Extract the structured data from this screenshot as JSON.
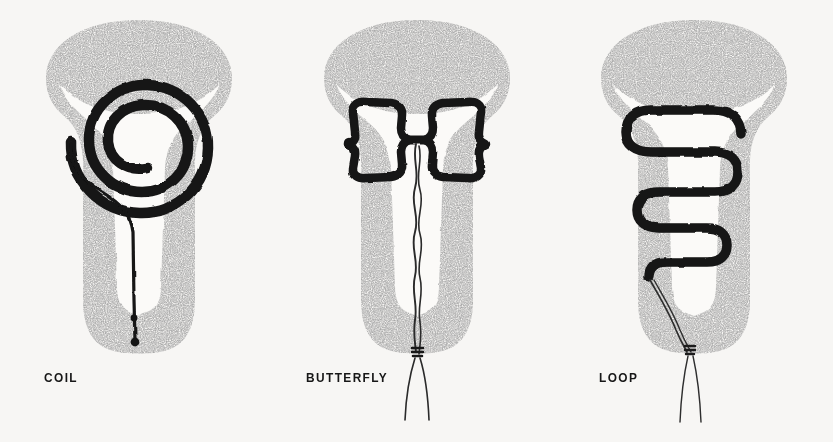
{
  "plate": {
    "title": "Intrauterine contraceptive device types",
    "background_color": "#f7f6f4",
    "ink_color": "#111111",
    "tissue_color": "#8d8d8d"
  },
  "figures": [
    {
      "id": "coil",
      "label": "COIL",
      "device_name": "coil-iud",
      "device_shape": "spiral",
      "device_turns": 2.5,
      "string_style": "single-thick-line",
      "string_markers": 2,
      "string_extends_beyond_cervix": false,
      "organ": "uterus-coronal-section"
    },
    {
      "id": "butterfly",
      "label": "BUTTERFLY",
      "device_name": "butterfly-iud",
      "device_shape": "двух-lobed-bowtie",
      "device_lobes": 2,
      "string_style": "wavy-double-thread",
      "string_markers": 0,
      "string_extends_beyond_cervix": true,
      "organ": "uterus-coronal-section"
    },
    {
      "id": "loop",
      "label": "LOOP",
      "device_name": "loop-iud",
      "device_shape": "serpentine-switchback",
      "device_switchbacks": 3,
      "string_style": "fine-double-thread",
      "string_markers": 0,
      "string_extends_beyond_cervix": true,
      "organ": "uterus-coronal-section"
    }
  ]
}
